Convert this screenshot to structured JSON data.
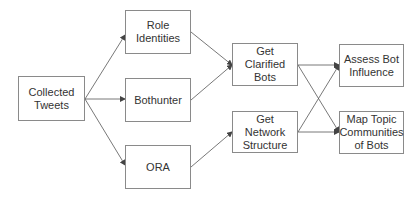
{
  "diagram": {
    "type": "flowchart",
    "colors": {
      "stroke": "#8a8a8a",
      "edge": "#555555",
      "text": "#333333",
      "fill": "#ffffff"
    },
    "nodes": [
      {
        "id": "collected",
        "label": "Collected Tweets",
        "x": 18,
        "y": 76,
        "w": 67,
        "h": 45
      },
      {
        "id": "role",
        "label": "Role Identities",
        "x": 125,
        "y": 10,
        "w": 66,
        "h": 44
      },
      {
        "id": "bothunter",
        "label": "Bothunter",
        "x": 125,
        "y": 78,
        "w": 66,
        "h": 44
      },
      {
        "id": "ora",
        "label": "ORA",
        "x": 125,
        "y": 145,
        "w": 66,
        "h": 44
      },
      {
        "id": "clarified",
        "label": "Get Clarified Bots",
        "x": 232,
        "y": 43,
        "w": 66,
        "h": 43
      },
      {
        "id": "network",
        "label": "Get Network Structure",
        "x": 232,
        "y": 111,
        "w": 66,
        "h": 42
      },
      {
        "id": "assess",
        "label": "Assess Bot Influence",
        "x": 339,
        "y": 44,
        "w": 65,
        "h": 43
      },
      {
        "id": "maptopic",
        "label": "Map Topic Communities of Bots",
        "x": 339,
        "y": 111,
        "w": 65,
        "h": 43
      }
    ],
    "edges": [
      {
        "from": "collected",
        "to": "role",
        "x1": 85,
        "y1": 99,
        "x2": 125,
        "y2": 35
      },
      {
        "from": "collected",
        "to": "bothunter",
        "x1": 85,
        "y1": 99,
        "x2": 125,
        "y2": 99
      },
      {
        "from": "collected",
        "to": "ora",
        "x1": 85,
        "y1": 99,
        "x2": 125,
        "y2": 165
      },
      {
        "from": "role",
        "to": "clarified",
        "x1": 191,
        "y1": 32,
        "x2": 232,
        "y2": 65
      },
      {
        "from": "bothunter",
        "to": "clarified",
        "x1": 191,
        "y1": 100,
        "x2": 232,
        "y2": 65
      },
      {
        "from": "ora",
        "to": "network",
        "x1": 191,
        "y1": 167,
        "x2": 232,
        "y2": 132
      },
      {
        "from": "clarified",
        "to": "assess",
        "x1": 298,
        "y1": 65,
        "x2": 339,
        "y2": 65
      },
      {
        "from": "clarified",
        "to": "maptopic",
        "x1": 298,
        "y1": 65,
        "x2": 339,
        "y2": 132
      },
      {
        "from": "network",
        "to": "assess",
        "x1": 298,
        "y1": 132,
        "x2": 339,
        "y2": 65
      },
      {
        "from": "network",
        "to": "maptopic",
        "x1": 298,
        "y1": 132,
        "x2": 339,
        "y2": 132
      }
    ]
  }
}
